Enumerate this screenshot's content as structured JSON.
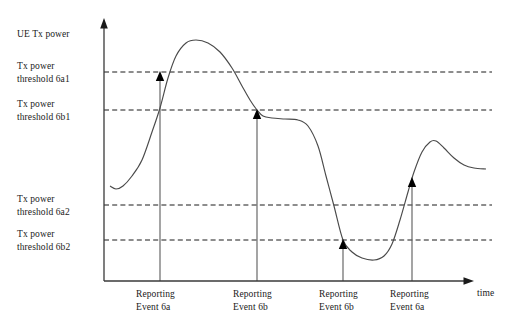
{
  "figure": {
    "y_axis_label": "UE Tx power",
    "x_axis_label": "time"
  },
  "thresholds": [
    {
      "id": "6a1",
      "line1": "Tx power",
      "line2": "threshold 6a1",
      "y": 72,
      "label_top": 60
    },
    {
      "id": "6b1",
      "line1": "Tx power",
      "line2": "threshold 6b1",
      "y": 110,
      "label_top": 98
    },
    {
      "id": "6a2",
      "line1": "Tx power",
      "line2": "threshold 6a2",
      "y": 205,
      "label_top": 193
    },
    {
      "id": "6b2",
      "line1": "Tx power",
      "line2": "threshold 6b2",
      "y": 240,
      "label_top": 228
    }
  ],
  "events": [
    {
      "index": 1,
      "line1": "Reporting",
      "line2": "Event 6a",
      "x": 160,
      "marker_y": 72,
      "label_left": 136
    },
    {
      "index": 2,
      "line1": "Reporting",
      "line2": "Event 6b",
      "x": 257,
      "marker_y": 110,
      "label_left": 233
    },
    {
      "index": 3,
      "line1": "Reporting",
      "line2": "Event 6b",
      "x": 343,
      "marker_y": 240,
      "label_left": 319
    },
    {
      "index": 4,
      "line1": "Reporting",
      "line2": "Event 6a",
      "x": 412,
      "marker_y": 178,
      "label_left": 390
    }
  ],
  "chart_data": {
    "type": "line",
    "title": "",
    "xlabel": "time",
    "ylabel": "UE Tx power",
    "grid": false,
    "legend": "none",
    "axis": {
      "origin_x": 104,
      "baseline_y": 281,
      "y_arrow_tip_y": 20,
      "x_arrow_tip_x": 472,
      "dash_line_right_x": 492
    },
    "threshold_values": {
      "6a1": 72,
      "6b1": 110,
      "6a2": 205,
      "6b2": 240
    },
    "series": [
      {
        "name": "UE Tx power",
        "points": [
          [
            110,
            186
          ],
          [
            116,
            189
          ],
          [
            123,
            186
          ],
          [
            132,
            176
          ],
          [
            142,
            160
          ],
          [
            152,
            132
          ],
          [
            160,
            108
          ],
          [
            168,
            78
          ],
          [
            176,
            56
          ],
          [
            186,
            43
          ],
          [
            196,
            40
          ],
          [
            208,
            43
          ],
          [
            220,
            52
          ],
          [
            232,
            68
          ],
          [
            242,
            86
          ],
          [
            250,
            100
          ],
          [
            257,
            110
          ],
          [
            263,
            116
          ],
          [
            272,
            118
          ],
          [
            285,
            119
          ],
          [
            298,
            120
          ],
          [
            308,
            126
          ],
          [
            318,
            146
          ],
          [
            326,
            176
          ],
          [
            334,
            206
          ],
          [
            343,
            240
          ],
          [
            352,
            252
          ],
          [
            362,
            258
          ],
          [
            374,
            260
          ],
          [
            384,
            256
          ],
          [
            392,
            244
          ],
          [
            400,
            220
          ],
          [
            408,
            192
          ],
          [
            414,
            172
          ],
          [
            422,
            152
          ],
          [
            430,
            142
          ],
          [
            436,
            141
          ],
          [
            444,
            148
          ],
          [
            454,
            158
          ],
          [
            464,
            165
          ],
          [
            474,
            168
          ],
          [
            486,
            169
          ]
        ]
      }
    ]
  }
}
